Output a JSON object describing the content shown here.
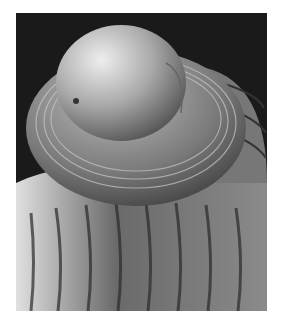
{
  "image": {
    "subject": "SEM micrograph of a spiral shell apex",
    "background_color": "#ffffff",
    "frame_background": "#1a1a1a",
    "shell_light": "#d8d8d8",
    "shell_mid": "#9a9a9a",
    "shell_dark": "#4a4a4a"
  }
}
